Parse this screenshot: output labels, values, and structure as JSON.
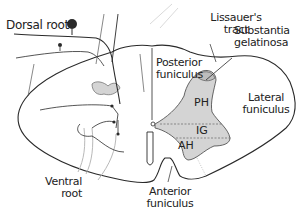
{
  "diagram": {
    "colors": {
      "outline": "#2a2a2a",
      "gray_matter_fill": "#d4d4d4",
      "faint_lines": "#b8b8b8",
      "background": "#ffffff"
    },
    "labels": {
      "dorsal_root": "Dorsal root",
      "lissauers_tract_1": "Lissauer's",
      "lissauers_tract_2": "tract",
      "substantia_gelatinosa_1": "Substantia",
      "substantia_gelatinosa_2": "gelatinosa",
      "posterior_funiculus_1": "Posterior",
      "posterior_funiculus_2": "funiculus",
      "lateral_funiculus_1": "Lateral",
      "lateral_funiculus_2": "funiculus",
      "ventral_root_1": "Ventral",
      "ventral_root_2": "root",
      "anterior_funiculus_1": "Anterior",
      "anterior_funiculus_2": "funiculus"
    },
    "gray_matter_regions": {
      "posterior_horn": "PH",
      "intermediate_gray": "IG",
      "anterior_horn": "AH"
    }
  }
}
